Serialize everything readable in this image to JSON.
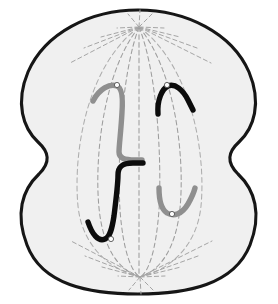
{
  "figure": {
    "stage_label": "Telophase / Cytokinesis",
    "background_color": "#ffffff"
  },
  "cell": {
    "name": "dividing-cell",
    "fill_color": "#f0f0f0",
    "outline_color": "#161616",
    "outline_width": 3.1,
    "description": "Rounded cell with a cleavage furrow pinching the middle into two forming daughter cells",
    "outline_path": "M 138 10 C 186 10 232 33 249 72 C 262 103 254 128 239 142 C 228 152 226 162 238 174 C 255 190 262 214 250 245 C 234 285 187 294 138 294 C 89 294 42 285 27 245 C 15 214 22 190 39 174 C 51 162 49 152 38 142 C 23 128 15 103 28 72 C 45 33 90 10 138 10 Z",
    "furrow": {
      "name": "cleavage-furrow",
      "left_x": 38,
      "right_x": 239,
      "y": 156,
      "label": "Cleavage furrow"
    }
  },
  "spindle": {
    "name": "mitotic-spindle",
    "line_color": "#9d9d9d",
    "dash_pattern": "4.6 3.2",
    "poles": [
      {
        "name": "spindle-pole-top",
        "x": 139,
        "y": 27,
        "label": "Upper spindle pole"
      },
      {
        "name": "spindle-pole-bottom",
        "x": 140,
        "y": 277,
        "label": "Lower spindle pole"
      }
    ],
    "envelope": {
      "name": "spindle-envelope",
      "left_path": "M 139 27 C 86 66 73 154 78 206 C 82 246 110 270 140 277",
      "right_path": "M 139 27 C 192 66 206 154 201 206 C 197 246 170 270 140 277"
    },
    "fibers": [
      {
        "name": "spindle-fiber-1",
        "path": "M 139 27 C 104 70 94 156 99 208 C 103 248 118 270 140 277"
      },
      {
        "name": "spindle-fiber-2",
        "path": "M 139 27 C 122 72 117 158 120 210 C 123 250 131 272 140 277"
      },
      {
        "name": "spindle-fiber-3",
        "path": "M 139 27 C 139 80 139 170 139 277"
      },
      {
        "name": "spindle-fiber-4",
        "path": "M 139 27 C 157 72 162 158 159 210 C 156 250 149 272 140 277"
      },
      {
        "name": "spindle-fiber-5",
        "path": "M 139 27 C 175 70 185 156 180 208 C 176 248 161 270 140 277"
      }
    ],
    "aster_top": {
      "name": "aster-top",
      "center_x": 139,
      "center_y": 27,
      "rays": [
        {
          "name": "aster-ray-top-1",
          "x2": 70,
          "y2": 63
        },
        {
          "name": "aster-ray-top-2",
          "x2": 84,
          "y2": 48
        },
        {
          "name": "aster-ray-top-3",
          "x2": 101,
          "y2": 37
        },
        {
          "name": "aster-ray-top-4",
          "x2": 117,
          "y2": 28
        },
        {
          "name": "aster-ray-top-5",
          "x2": 128,
          "y2": 14
        },
        {
          "name": "aster-ray-top-6",
          "x2": 140,
          "y2": 10
        },
        {
          "name": "aster-ray-top-7",
          "x2": 152,
          "y2": 14
        },
        {
          "name": "aster-ray-top-8",
          "x2": 164,
          "y2": 28
        },
        {
          "name": "aster-ray-top-9",
          "x2": 180,
          "y2": 37
        },
        {
          "name": "aster-ray-top-10",
          "x2": 197,
          "y2": 48
        },
        {
          "name": "aster-ray-top-11",
          "x2": 211,
          "y2": 63
        }
      ]
    },
    "aster_bottom": {
      "name": "aster-bottom",
      "center_x": 140,
      "center_y": 277,
      "rays": [
        {
          "name": "aster-ray-bottom-1",
          "x2": 71,
          "y2": 241
        },
        {
          "name": "aster-ray-bottom-2",
          "x2": 85,
          "y2": 256
        },
        {
          "name": "aster-ray-bottom-3",
          "x2": 102,
          "y2": 267
        },
        {
          "name": "aster-ray-bottom-4",
          "x2": 118,
          "y2": 276
        },
        {
          "name": "aster-ray-bottom-5",
          "x2": 129,
          "y2": 290
        },
        {
          "name": "aster-ray-bottom-6",
          "x2": 141,
          "y2": 294
        },
        {
          "name": "aster-ray-bottom-7",
          "x2": 153,
          "y2": 290
        },
        {
          "name": "aster-ray-bottom-8",
          "x2": 165,
          "y2": 276
        },
        {
          "name": "aster-ray-bottom-9",
          "x2": 181,
          "y2": 267
        },
        {
          "name": "aster-ray-bottom-10",
          "x2": 198,
          "y2": 256
        },
        {
          "name": "aster-ray-bottom-11",
          "x2": 212,
          "y2": 241
        }
      ]
    }
  },
  "chromosomes": [
    {
      "name": "chromosome-grey-upper-left",
      "color": "#8f8f8f",
      "shape": "long J hook",
      "group": "upper-daughter-cell",
      "arm_path": "M 93 101 C 99 89 110 83 117 86 C 122 88 123 98 122 112 C 121 131 119 146 119 152 C 119 158 124 160 135 160 L 142 160",
      "centromere": {
        "name": "centromere-grey-upper-left",
        "x": 117,
        "y": 85,
        "r": 2.6
      }
    },
    {
      "name": "chromosome-black-upper-right",
      "color": "#0c0c0c",
      "shape": "inverted V",
      "group": "upper-daughter-cell",
      "arm_path": "M 158 114 C 157 100 162 89 168 86 C 175 83 183 90 188 100 C 191 106 192 108 193 110",
      "centromere": {
        "name": "centromere-black-upper-right",
        "x": 167,
        "y": 85,
        "r": 2.6
      }
    },
    {
      "name": "chromosome-black-lower-left",
      "color": "#0c0c0c",
      "shape": "long J hook",
      "group": "lower-daughter-cell",
      "arm_path": "M 143 163 L 133 163 C 122 163 118 167 118 175 C 118 183 116 200 114 216 C 112 229 110 237 105 239 C 98 242 92 234 88 222",
      "centromere": {
        "name": "centromere-black-lower-left",
        "x": 111,
        "y": 239,
        "r": 2.6
      }
    },
    {
      "name": "chromosome-grey-lower-right",
      "color": "#8f8f8f",
      "shape": "U curve",
      "group": "lower-daughter-cell",
      "arm_path": "M 159 188 C 159 200 161 209 167 213 C 174 217 182 214 188 204 C 192 197 194 192 195 188",
      "centromere": {
        "name": "centromere-grey-lower-right",
        "x": 172,
        "y": 214,
        "r": 2.6
      }
    }
  ]
}
